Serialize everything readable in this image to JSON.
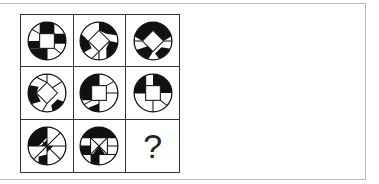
{
  "puzzle": {
    "type": "3x3 figure matrix",
    "rows": 3,
    "cols": 3,
    "cells": [
      {
        "row": 1,
        "col": 1,
        "description": "circle with center square, black segments top-left, right, bottom-left"
      },
      {
        "row": 1,
        "col": 2,
        "description": "circle with center diamond, black segments top-right, left, bottom-right"
      },
      {
        "row": 1,
        "col": 3,
        "description": "circle with center diamond, black segments top, bottom-left, bottom-right"
      },
      {
        "row": 2,
        "col": 1,
        "description": "circle with center diamond, black segments left, bottom-right"
      },
      {
        "row": 2,
        "col": 2,
        "description": "circle with center square, black segments top-left, bottom"
      },
      {
        "row": 2,
        "col": 3,
        "description": "circle with center square, black segments top-left, top-right"
      },
      {
        "row": 3,
        "col": 1,
        "description": "circle with pinwheel triangles, black top-left and bottom"
      },
      {
        "row": 3,
        "col": 2,
        "description": "circle with hourglass, black top, center, bottom-left"
      },
      {
        "row": 3,
        "col": 3,
        "description": "unknown"
      }
    ],
    "missing_label": "?"
  },
  "colors": {
    "ink": "#111111",
    "frame": "#b8b8b8",
    "background": "#ffffff"
  }
}
